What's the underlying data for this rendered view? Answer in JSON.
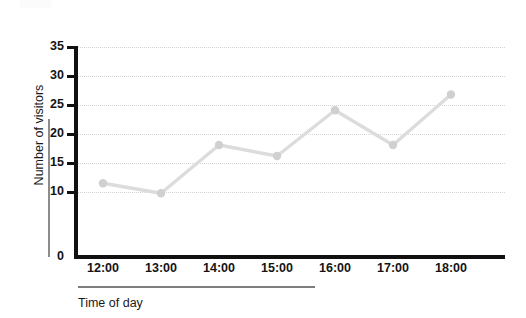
{
  "chart_data": {
    "type": "line",
    "title": "",
    "xlabel": "Time of day",
    "ylabel": "Number of visitors",
    "categories": [
      "12:00",
      "13:00",
      "14:00",
      "15:00",
      "16:00",
      "17:00",
      "18:00"
    ],
    "values": [
      11.5,
      9.8,
      18.1,
      16.2,
      24.1,
      18.1,
      26.8
    ],
    "series": [
      {
        "name": "Number of visitors",
        "values": [
          11.5,
          9.8,
          18.1,
          16.2,
          24.1,
          18.1,
          26.8
        ]
      }
    ],
    "y_tick_labels": [
      "0",
      "10",
      "15",
      "20",
      "25",
      "30",
      "35"
    ],
    "y_tick_values": [
      0,
      10,
      15,
      20,
      25,
      30,
      35
    ],
    "ylim": [
      0,
      35
    ],
    "xlim": [
      "12:00",
      "18:00"
    ],
    "grid": "horizontal-dotted",
    "legend": "none",
    "axis_note": "y-axis label 5 omitted; spacing between 0 and 10 is compressed",
    "colors": {
      "line": "#dcdcdc",
      "marker": "#d0d0d0",
      "axis": "#111111",
      "grid": "#d5d5d5",
      "text": "#141414",
      "rule": "#8c8c8c"
    }
  }
}
